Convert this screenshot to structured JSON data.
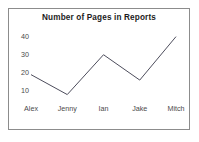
{
  "chart_data": {
    "type": "line",
    "title": "Number of Pages in Reports",
    "xlabel": "",
    "ylabel": "",
    "categories": [
      "Alex",
      "Jenny",
      "Ian",
      "Jake",
      "Mitch"
    ],
    "values": [
      19,
      8,
      30,
      16,
      40
    ],
    "series": [
      {
        "name": "Number of Pages",
        "values": [
          19,
          8,
          30,
          16,
          40
        ]
      }
    ],
    "ytick_labels": [
      "40",
      "30",
      "20",
      "10"
    ],
    "yticks": [
      40,
      30,
      20,
      10
    ],
    "ylim": [
      5,
      42
    ],
    "xlim": [
      0,
      4
    ],
    "grid": false,
    "legend": false,
    "markers": false,
    "line_color": "#4d4d5c",
    "title_color": "#1c1c1c",
    "tick_color": "#4a4a4a",
    "border_color": "#8c8c8c",
    "background_color": "#ffffff"
  }
}
